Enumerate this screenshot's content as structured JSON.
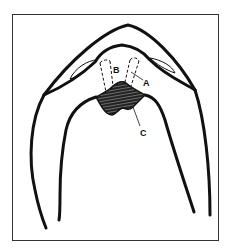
{
  "figure": {
    "type": "anatomical line drawing",
    "frame": {
      "x": 12,
      "y": 14,
      "width": 207,
      "height": 227,
      "color": "#333333"
    },
    "stroke_color": "#111111",
    "background": "#ffffff",
    "labels": [
      {
        "id": "A",
        "text": "A",
        "x": 143,
        "y": 86
      },
      {
        "id": "B",
        "text": "B",
        "x": 113,
        "y": 73
      },
      {
        "id": "C",
        "text": "C",
        "x": 140,
        "y": 136
      }
    ],
    "hatched_region": "C"
  }
}
